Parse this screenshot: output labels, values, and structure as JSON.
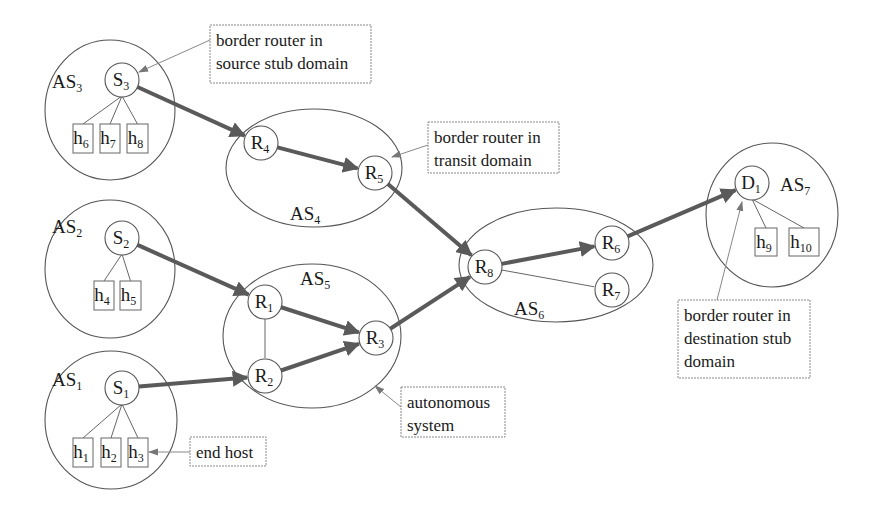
{
  "diagram": {
    "domains": [
      {
        "id": "AS3",
        "label": "AS",
        "sub": "3",
        "shape": "ellipse",
        "cx": 110,
        "cy": 110,
        "rx": 65,
        "ry": 70,
        "lx": 52,
        "ly": 88
      },
      {
        "id": "AS2",
        "label": "AS",
        "sub": "2",
        "shape": "ellipse",
        "cx": 110,
        "cy": 269,
        "rx": 65,
        "ry": 69,
        "lx": 52,
        "ly": 233
      },
      {
        "id": "AS1",
        "label": "AS",
        "sub": "1",
        "shape": "ellipse",
        "cx": 111,
        "cy": 420,
        "rx": 66,
        "ry": 69,
        "lx": 52,
        "ly": 386
      },
      {
        "id": "AS4",
        "label": "AS",
        "sub": "4",
        "shape": "ellipse",
        "cx": 314,
        "cy": 168,
        "rx": 88,
        "ry": 59,
        "lx": 290,
        "ly": 220
      },
      {
        "id": "AS5",
        "label": "AS",
        "sub": "5",
        "shape": "ellipse",
        "cx": 312,
        "cy": 336,
        "rx": 89,
        "ry": 72,
        "lx": 300,
        "ly": 285
      },
      {
        "id": "AS6",
        "label": "AS",
        "sub": "6",
        "shape": "ellipse",
        "cx": 556,
        "cy": 265,
        "rx": 97,
        "ry": 57,
        "lx": 514,
        "ly": 315
      },
      {
        "id": "AS7",
        "label": "AS",
        "sub": "7",
        "shape": "ellipse",
        "cx": 772,
        "cy": 215,
        "rx": 66,
        "ry": 72,
        "lx": 780,
        "ly": 191
      }
    ],
    "routers": [
      {
        "id": "S3",
        "label": "S",
        "sub": "3",
        "cx": 122,
        "cy": 80
      },
      {
        "id": "S2",
        "label": "S",
        "sub": "2",
        "cx": 122,
        "cy": 238
      },
      {
        "id": "S1",
        "label": "S",
        "sub": "1",
        "cx": 122,
        "cy": 388
      },
      {
        "id": "R4",
        "label": "R",
        "sub": "4",
        "cx": 261,
        "cy": 143
      },
      {
        "id": "R5",
        "label": "R",
        "sub": "5",
        "cx": 375,
        "cy": 173
      },
      {
        "id": "R1",
        "label": "R",
        "sub": "1",
        "cx": 265,
        "cy": 302
      },
      {
        "id": "R2",
        "label": "R",
        "sub": "2",
        "cx": 265,
        "cy": 376
      },
      {
        "id": "R3",
        "label": "R",
        "sub": "3",
        "cx": 376,
        "cy": 338
      },
      {
        "id": "R8",
        "label": "R",
        "sub": "8",
        "cx": 485,
        "cy": 267
      },
      {
        "id": "R6",
        "label": "R",
        "sub": "6",
        "cx": 612,
        "cy": 243
      },
      {
        "id": "R7",
        "label": "R",
        "sub": "7",
        "cx": 612,
        "cy": 290
      },
      {
        "id": "D1",
        "label": "D",
        "sub": "1",
        "cx": 752,
        "cy": 183
      }
    ],
    "hosts": [
      {
        "id": "h6",
        "label": "h",
        "sub": "6",
        "x": 73,
        "y": 124,
        "w": 20,
        "h": 29,
        "parent": "S3"
      },
      {
        "id": "h7",
        "label": "h",
        "sub": "7",
        "x": 100,
        "y": 124,
        "w": 20,
        "h": 29,
        "parent": "S3"
      },
      {
        "id": "h8",
        "label": "h",
        "sub": "8",
        "x": 127,
        "y": 124,
        "w": 21,
        "h": 29,
        "parent": "S3"
      },
      {
        "id": "h4",
        "label": "h",
        "sub": "4",
        "x": 94,
        "y": 281,
        "w": 20,
        "h": 29,
        "parent": "S2"
      },
      {
        "id": "h5",
        "label": "h",
        "sub": "5",
        "x": 120,
        "y": 281,
        "w": 21,
        "h": 29,
        "parent": "S2"
      },
      {
        "id": "h1",
        "label": "h",
        "sub": "1",
        "x": 73,
        "y": 438,
        "w": 20,
        "h": 29,
        "parent": "S1"
      },
      {
        "id": "h2",
        "label": "h",
        "sub": "2",
        "x": 101,
        "y": 438,
        "w": 20,
        "h": 29,
        "parent": "S1"
      },
      {
        "id": "h3",
        "label": "h",
        "sub": "3",
        "x": 128,
        "y": 438,
        "w": 20,
        "h": 29,
        "parent": "S1"
      },
      {
        "id": "h9",
        "label": "h",
        "sub": "9",
        "x": 755,
        "y": 228,
        "w": 22,
        "h": 28,
        "parent": "D1"
      },
      {
        "id": "h10",
        "label": "h",
        "sub": "10",
        "x": 789,
        "y": 228,
        "w": 30,
        "h": 28,
        "parent": "D1"
      }
    ],
    "paths": [
      {
        "from": "S3",
        "to": "R4",
        "style": "thick"
      },
      {
        "from": "R4",
        "to": "R5",
        "style": "thick"
      },
      {
        "from": "R5",
        "to": "R8",
        "style": "thick"
      },
      {
        "from": "S2",
        "to": "R1",
        "style": "thick"
      },
      {
        "from": "S1",
        "to": "R2",
        "style": "thick"
      },
      {
        "from": "R1",
        "to": "R3",
        "style": "thick"
      },
      {
        "from": "R2",
        "to": "R3",
        "style": "thick"
      },
      {
        "from": "R3",
        "to": "R8",
        "style": "thick"
      },
      {
        "from": "R8",
        "to": "R6",
        "style": "thick"
      },
      {
        "from": "R6",
        "to": "D1",
        "style": "thick"
      },
      {
        "from": "R1",
        "to": "R2",
        "style": "thin"
      },
      {
        "from": "R8",
        "to": "R7",
        "style": "thin"
      }
    ],
    "callouts": [
      {
        "id": "callout-source-border",
        "lines": [
          "border router in",
          "source stub domain"
        ],
        "x": 210,
        "y": 25,
        "w": 161,
        "h": 58,
        "ax": 210,
        "ay": 40,
        "tx": 139,
        "ty": 72
      },
      {
        "id": "callout-transit-border",
        "lines": [
          "border router in",
          "transit domain"
        ],
        "x": 428,
        "y": 122,
        "w": 131,
        "h": 51,
        "ax": 428,
        "ay": 145,
        "tx": 392,
        "ty": 157
      },
      {
        "id": "callout-dest-border",
        "lines": [
          "border router in",
          "destination stub",
          "domain"
        ],
        "x": 678,
        "y": 300,
        "w": 132,
        "h": 78,
        "ax": 717,
        "ay": 300,
        "tx": 742,
        "ty": 202
      },
      {
        "id": "callout-autonomous-system",
        "lines": [
          "autonomous",
          "system"
        ],
        "x": 401,
        "y": 387,
        "w": 104,
        "h": 50,
        "ax": 401,
        "ay": 407,
        "tx": 375,
        "ty": 386
      },
      {
        "id": "callout-end-host",
        "lines": [
          "end host"
        ],
        "x": 190,
        "y": 437,
        "w": 76,
        "h": 29,
        "ax": 190,
        "ay": 452,
        "tx": 149,
        "ty": 452
      }
    ],
    "router_radius": 17
  }
}
